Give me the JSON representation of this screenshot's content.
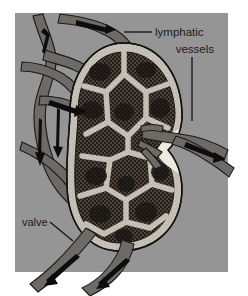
{
  "figure": {
    "background_color": "#ffffff",
    "panel_color": "#9a9a9a",
    "panel": {
      "x": 15,
      "y": 13,
      "width": 213,
      "height": 259
    }
  },
  "labels": {
    "lymphatic_vessels": {
      "line1": "lymphatic",
      "line2": "vessels",
      "color": "#1a1a1a"
    },
    "valve": {
      "text": "valve",
      "color": "#1a1a1a"
    }
  },
  "leader_lines": {
    "lymphatic_horizontal": {
      "x1": 124,
      "y1": 32,
      "x2": 152,
      "y2": 32
    },
    "vessels_vertical": {
      "x1": 192,
      "y1": 57,
      "x2": 192,
      "y2": 121
    },
    "valve_diagonal": {
      "x1": 50,
      "y1": 222,
      "x2": 73,
      "y2": 241
    }
  },
  "node": {
    "name": "lymph node",
    "capsule_color": "#efeade",
    "cortex_color": "#2a2520",
    "stipple_color": "#5a5048",
    "outline_color": "#141210",
    "bounds": {
      "x": 66,
      "y": 43,
      "width": 118,
      "height": 208
    }
  },
  "vessels": {
    "fill_color": "#6e6a66",
    "outline_color": "#1a1a1a",
    "arrow_color": "#0d0d0d",
    "afferent_count": 4,
    "efferent_count": 3,
    "flow_arrows": [
      {
        "name": "afferent-top-left-arrow",
        "direction": "down-right"
      },
      {
        "name": "afferent-top-right-arrow",
        "direction": "right"
      },
      {
        "name": "afferent-mid-left-arrow",
        "direction": "down-right"
      },
      {
        "name": "afferent-lower-left-arrow",
        "direction": "down"
      },
      {
        "name": "efferent-right-arrow",
        "direction": "right"
      },
      {
        "name": "efferent-bottom-left-arrow",
        "direction": "down-left"
      },
      {
        "name": "efferent-bottom-right-arrow",
        "direction": "down-left"
      }
    ]
  }
}
